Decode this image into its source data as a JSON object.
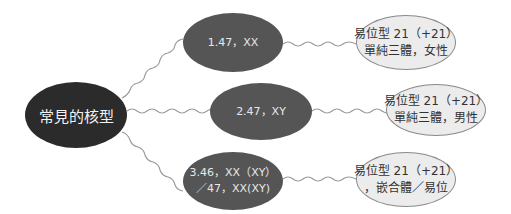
{
  "diagram": {
    "root": {
      "label": "常見的核型"
    },
    "branches": [
      {
        "karyotype": [
          "1.47，XX"
        ],
        "description": [
          "易位型 21（+21）",
          "單純三體，女性"
        ]
      },
      {
        "karyotype": [
          "2.47，XY"
        ],
        "description": [
          "易位型 21（+21）",
          "單純三體，男性"
        ]
      },
      {
        "karyotype": [
          "3.46，XX（XY）",
          "／47，XX(XY)"
        ],
        "description": [
          "易位型 21（+21）",
          "，嵌合體／易位"
        ]
      }
    ]
  },
  "colors": {
    "root": "#2b2b2b",
    "mid": "#555555",
    "leaf_fill": "#ececec",
    "leaf_border": "#8a8a8a",
    "connector": "#9a9a9a"
  }
}
